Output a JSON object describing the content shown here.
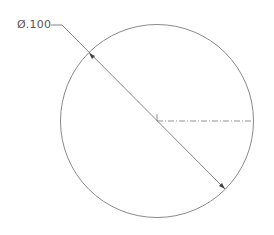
{
  "drawing": {
    "dimension_label": "Ø.100",
    "colors": {
      "background": "#ffffff",
      "circle": "#888888",
      "dimension_line": "#777777",
      "centerline": "#777777",
      "arrow": "#444444",
      "text": "#555555"
    },
    "circle": {
      "cx": 157,
      "cy": 121,
      "r": 96.5
    }
  }
}
